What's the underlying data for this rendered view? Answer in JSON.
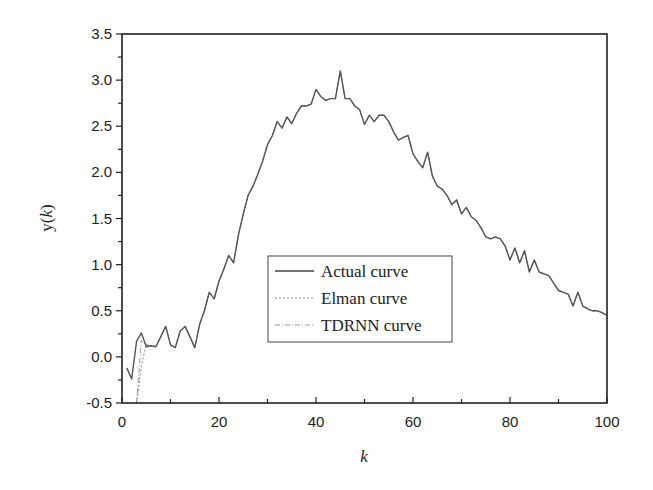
{
  "chart_data": {
    "type": "line",
    "title": "",
    "xlabel": "k",
    "ylabel": "y(k)",
    "xlim": [
      0,
      100
    ],
    "ylim": [
      -0.5,
      3.5
    ],
    "xticks": [
      0,
      20,
      40,
      60,
      80,
      100
    ],
    "xtick_labels": [
      "0",
      "20",
      "40",
      "60",
      "80",
      "100"
    ],
    "yticks": [
      -0.5,
      0.0,
      0.5,
      1.0,
      1.5,
      2.0,
      2.5,
      3.0,
      3.5
    ],
    "ytick_labels": [
      "-0.5",
      "0.0",
      "0.5",
      "1.0",
      "1.5",
      "2.0",
      "2.5",
      "3.0",
      "3.5"
    ],
    "grid": false,
    "legend_position": "center",
    "legend": [
      "Actual curve",
      "Elman curve",
      "TDRNN curve"
    ],
    "x": [
      1,
      2,
      3,
      4,
      5,
      6,
      7,
      8,
      9,
      10,
      11,
      12,
      13,
      14,
      15,
      16,
      17,
      18,
      19,
      20,
      21,
      22,
      23,
      24,
      25,
      26,
      27,
      28,
      29,
      30,
      31,
      32,
      33,
      34,
      35,
      36,
      37,
      38,
      39,
      40,
      41,
      42,
      43,
      44,
      45,
      46,
      47,
      48,
      49,
      50,
      51,
      52,
      53,
      54,
      55,
      56,
      57,
      58,
      59,
      60,
      61,
      62,
      63,
      64,
      65,
      66,
      67,
      68,
      69,
      70,
      71,
      72,
      73,
      74,
      75,
      76,
      77,
      78,
      79,
      80,
      81,
      82,
      83,
      84,
      85,
      86,
      87,
      88,
      89,
      90,
      91,
      92,
      93,
      94,
      95,
      96,
      97,
      98,
      99,
      100
    ],
    "series": [
      {
        "name": "Actual curve",
        "style": "solid",
        "values": [
          -0.12,
          -0.24,
          0.17,
          0.26,
          0.11,
          0.12,
          0.11,
          0.22,
          0.33,
          0.13,
          0.1,
          0.28,
          0.33,
          0.22,
          0.1,
          0.35,
          0.5,
          0.7,
          0.63,
          0.82,
          0.95,
          1.1,
          1.02,
          1.32,
          1.55,
          1.75,
          1.85,
          1.98,
          2.12,
          2.3,
          2.4,
          2.55,
          2.48,
          2.6,
          2.53,
          2.64,
          2.72,
          2.72,
          2.74,
          2.9,
          2.82,
          2.78,
          2.8,
          2.8,
          3.1,
          2.8,
          2.8,
          2.72,
          2.68,
          2.52,
          2.62,
          2.55,
          2.62,
          2.62,
          2.55,
          2.44,
          2.35,
          2.38,
          2.4,
          2.2,
          2.12,
          2.05,
          2.22,
          1.96,
          1.85,
          1.82,
          1.75,
          1.65,
          1.7,
          1.55,
          1.62,
          1.52,
          1.48,
          1.4,
          1.3,
          1.28,
          1.3,
          1.28,
          1.2,
          1.05,
          1.18,
          1.02,
          1.15,
          0.92,
          1.05,
          0.92,
          0.9,
          0.88,
          0.8,
          0.72,
          0.7,
          0.68,
          0.55,
          0.7,
          0.55,
          0.52,
          0.5,
          0.5,
          0.48,
          0.45
        ]
      },
      {
        "name": "Elman curve",
        "style": "dotted",
        "values": [
          null,
          null,
          -0.5,
          -0.1,
          0.14,
          0.12,
          0.11,
          0.22,
          0.33,
          0.13,
          0.1,
          0.28,
          0.33,
          0.22,
          0.1,
          0.35,
          0.5,
          0.7,
          0.63,
          0.82,
          0.95,
          1.1,
          1.02,
          1.32,
          1.55,
          1.75,
          1.85,
          1.98,
          2.12,
          2.3,
          2.4,
          2.55,
          2.48,
          2.6,
          2.53,
          2.64,
          2.72,
          2.72,
          2.74,
          2.9,
          2.82,
          2.78,
          2.8,
          2.8,
          3.1,
          2.8,
          2.8,
          2.72,
          2.68,
          2.52,
          2.62,
          2.55,
          2.62,
          2.62,
          2.55,
          2.44,
          2.35,
          2.38,
          2.4,
          2.2,
          2.12,
          2.05,
          2.22,
          1.96,
          1.85,
          1.82,
          1.75,
          1.65,
          1.7,
          1.55,
          1.62,
          1.52,
          1.48,
          1.4,
          1.3,
          1.28,
          1.3,
          1.28,
          1.2,
          1.05,
          1.18,
          1.02,
          1.15,
          0.92,
          1.05,
          0.92,
          0.9,
          0.88,
          0.8,
          0.72,
          0.7,
          0.68,
          0.55,
          0.7,
          0.55,
          0.52,
          0.5,
          0.5,
          0.48,
          0.45
        ]
      },
      {
        "name": "TDRNN curve",
        "style": "dash-dot",
        "values": [
          null,
          null,
          -0.5,
          0.18,
          0.12,
          0.12,
          0.11,
          0.22,
          0.33,
          0.13,
          0.1,
          0.28,
          0.33,
          0.22,
          0.1,
          0.35,
          0.5,
          0.7,
          0.63,
          0.82,
          0.95,
          1.1,
          1.02,
          1.32,
          1.55,
          1.75,
          1.85,
          1.98,
          2.12,
          2.3,
          2.4,
          2.55,
          2.48,
          2.6,
          2.53,
          2.64,
          2.72,
          2.72,
          2.74,
          2.9,
          2.82,
          2.78,
          2.8,
          2.8,
          3.1,
          2.8,
          2.8,
          2.72,
          2.68,
          2.52,
          2.62,
          2.55,
          2.62,
          2.62,
          2.55,
          2.44,
          2.35,
          2.38,
          2.4,
          2.2,
          2.12,
          2.05,
          2.22,
          1.96,
          1.85,
          1.82,
          1.75,
          1.65,
          1.7,
          1.55,
          1.62,
          1.52,
          1.48,
          1.4,
          1.3,
          1.28,
          1.3,
          1.28,
          1.2,
          1.05,
          1.18,
          1.02,
          1.15,
          0.92,
          1.05,
          0.92,
          0.9,
          0.88,
          0.8,
          0.72,
          0.7,
          0.68,
          0.55,
          0.7,
          0.55,
          0.52,
          0.5,
          0.5,
          0.48,
          0.45
        ]
      }
    ]
  },
  "colors": {
    "axis": "#222222",
    "actual": "#555555",
    "elman": "#8a8a8a",
    "tdrnn": "#9a9a9a",
    "legend_border": "#444444"
  }
}
